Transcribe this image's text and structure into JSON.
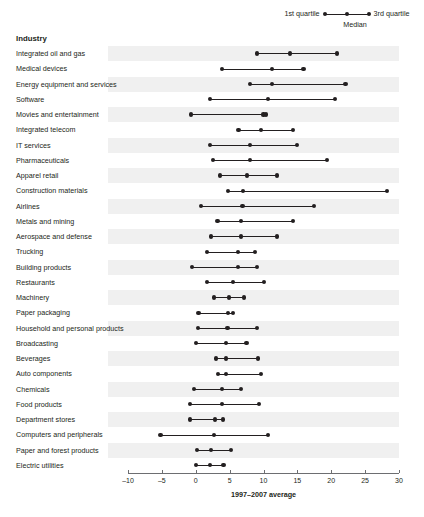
{
  "legend": {
    "left_label": "1st quartile",
    "right_label": "3rd quartile",
    "median_label": "Median"
  },
  "header": {
    "industry": "Industry"
  },
  "axis": {
    "xlabel": "1997–2007 average",
    "ticks": [
      "–10",
      "–5",
      "0",
      "5",
      "10",
      "15",
      "20",
      "25",
      "30"
    ]
  },
  "colors": {
    "ink": "#231f20",
    "band": "#f0f0f0",
    "axis": "#6d6e71"
  },
  "chart_data": {
    "type": "box",
    "title": "",
    "subtitle": "",
    "xlabel": "1997–2007 average",
    "ylabel": "Industry",
    "xlim": [
      -10,
      30
    ],
    "xticks": [
      -10,
      -5,
      0,
      5,
      10,
      15,
      20,
      25,
      30
    ],
    "grid": false,
    "legend_position": "top-right",
    "series_names": [
      "1st quartile",
      "Median",
      "3rd quartile"
    ],
    "categories": [
      "Integrated oil and gas",
      "Medical devices",
      "Energy equipment and services",
      "Software",
      "Movies and entertainment",
      "Integrated telecom",
      "IT services",
      "Pharmaceuticals",
      "Apparel retail",
      "Construction materials",
      "Airlines",
      "Metals and mining",
      "Aerospace and defense",
      "Trucking",
      "Building products",
      "Restaurants",
      "Machinery",
      "Paper packaging",
      "Household and personal products",
      "Broadcasting",
      "Beverages",
      "Auto components",
      "Chemicals",
      "Food products",
      "Department stores",
      "Computers and peripherals",
      "Paper and forest products",
      "Electric utilities"
    ],
    "q1": [
      9.0,
      3.9,
      8.0,
      2.1,
      -0.7,
      6.3,
      2.1,
      2.5,
      3.6,
      4.8,
      0.8,
      3.2,
      2.3,
      1.7,
      -0.5,
      1.7,
      2.7,
      0.4,
      0.3,
      0.0,
      3.0,
      3.3,
      -0.2,
      -0.8,
      -0.9,
      -5.2,
      0.2,
      0.0
    ],
    "median": [
      13.9,
      11.3,
      11.3,
      10.7,
      10.0,
      9.6,
      8.0,
      8.0,
      7.6,
      7.0,
      6.9,
      6.7,
      6.7,
      6.2,
      6.2,
      5.5,
      4.9,
      4.8,
      4.7,
      4.5,
      4.5,
      4.5,
      3.9,
      3.9,
      2.8,
      2.7,
      2.2,
      2.1
    ],
    "q3": [
      20.9,
      15.9,
      22.1,
      20.5,
      10.4,
      14.4,
      15.0,
      19.4,
      12.0,
      28.2,
      17.4,
      14.4,
      12.0,
      8.7,
      9.1,
      10.1,
      7.1,
      5.5,
      9.1,
      7.5,
      9.2,
      9.6,
      6.7,
      9.3,
      4.0,
      10.7,
      5.2,
      4.1
    ]
  }
}
